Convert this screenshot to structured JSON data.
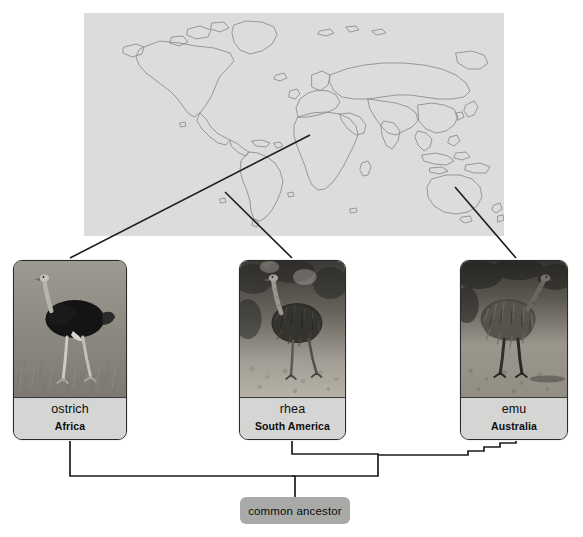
{
  "diagram": {
    "map": {
      "name": "world-map",
      "background_color": "#dcdcdb",
      "outline_color": "#8a8a88"
    },
    "colors": {
      "card_border": "#2a2a2a",
      "card_label_background": "#d5d5d3",
      "ancestor_background": "#a9a9a7",
      "connector_line": "#1d1d1d",
      "text": "#0d0d0d"
    },
    "species": [
      {
        "id": "ostrich",
        "name": "ostrich",
        "region": "Africa",
        "photo_alt": "black and white photograph of an ostrich walking in grassland"
      },
      {
        "id": "rhea",
        "name": "rhea",
        "region": "South America",
        "photo_alt": "black and white photograph of a rhea standing on open ground"
      },
      {
        "id": "emu",
        "name": "emu",
        "region": "Australia",
        "photo_alt": "black and white photograph of an emu walking on dry ground"
      }
    ],
    "ancestor": {
      "label": "common ancestor"
    },
    "map_leaders": [
      {
        "from_region": "Africa",
        "to_card": "ostrich"
      },
      {
        "from_region": "South America",
        "to_card": "rhea"
      },
      {
        "from_region": "Australia",
        "to_card": "emu"
      }
    ]
  }
}
